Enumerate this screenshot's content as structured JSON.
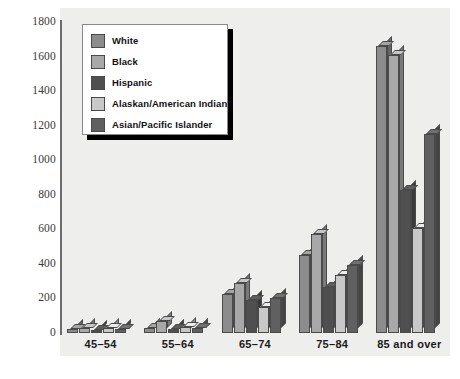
{
  "chart_data": {
    "type": "bar",
    "title": "",
    "subtitle": "",
    "xlabel": "",
    "ylabel": "",
    "ylim": [
      0,
      1800
    ],
    "ytick_step": 200,
    "yticks": [
      1800,
      1600,
      1400,
      1200,
      1000,
      800,
      600,
      400,
      200,
      0
    ],
    "grid": false,
    "legend_position": "top-left",
    "style": "3d-bars",
    "categories": [
      "45–54",
      "55–64",
      "65–74",
      "75–84",
      "85 and over"
    ],
    "series": [
      {
        "name": "White",
        "color": "#8c8c8c",
        "values": [
          25,
          30,
          225,
          450,
          1660
        ]
      },
      {
        "name": "Black",
        "color": "#a8a8a8",
        "values": [
          30,
          70,
          290,
          575,
          1610
        ]
      },
      {
        "name": "Hispanic",
        "color": "#4f4f4f",
        "values": [
          20,
          25,
          190,
          265,
          830
        ]
      },
      {
        "name": "Alaskan/American Indian",
        "color": "#c8c8c8",
        "values": [
          28,
          35,
          150,
          335,
          610
        ]
      },
      {
        "name": "Asian/Pacific Islander",
        "color": "#606060",
        "values": [
          22,
          30,
          200,
          395,
          1150
        ]
      }
    ]
  },
  "legend": {
    "items": [
      {
        "label": "White"
      },
      {
        "label": "Black"
      },
      {
        "label": "Hispanic"
      },
      {
        "label": "Alaskan/American Indian"
      },
      {
        "label": "Asian/Pacific Islander"
      }
    ]
  },
  "colors": {
    "plot_background": "#eeeeec",
    "axis": "#6b6b6b",
    "bar_outline": "#4a4a4a",
    "legend_border": "#8a8a8a",
    "legend_shadow": "#000000",
    "text": "#1a1a1a"
  }
}
